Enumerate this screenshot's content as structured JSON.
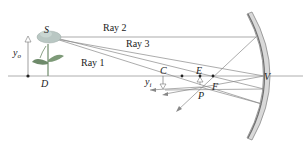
{
  "diagram": {
    "rays": [
      {
        "label": "Ray 1"
      },
      {
        "label": "Ray 2"
      },
      {
        "label": "Ray 3"
      }
    ],
    "points": {
      "source": "S",
      "object_base": "D",
      "center": "C",
      "image_tip": "E",
      "focus": "F",
      "image_point": "P",
      "vertex": "V"
    },
    "heights": {
      "object": "y",
      "object_sub": "o",
      "image": "y",
      "image_sub": "i"
    },
    "colors": {
      "ray": "#888888",
      "axis": "#999999",
      "mirror_fill": "#d8d8d8",
      "mirror_edge": "#8a8a8a",
      "flower": "#b9c7c3",
      "leaf": "#6e8a6a",
      "text": "#222222"
    }
  }
}
